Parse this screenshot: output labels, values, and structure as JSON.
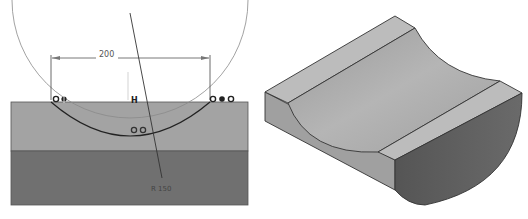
{
  "sketch": {
    "dimension_width": "200",
    "radius_label": "R 150",
    "constraint_left": [
      "coincident",
      "fix"
    ],
    "constraint_right": [
      "coincident",
      "fix",
      "coincident"
    ],
    "constraint_mid_top": "H",
    "constraint_arc": [
      "coincident",
      "coincident"
    ]
  },
  "isometric": {
    "description": "Extruded block with concave cylindrical groove"
  },
  "colors": {
    "upper_band": "#a3a3a3",
    "lower_band": "#707070",
    "sketch_line": "#333333",
    "construction_circle": "#888888",
    "iso_top": "#b8b8b8",
    "iso_groove": "#a8a8a8",
    "iso_front": "#9c9c9c",
    "iso_side": "#5e5e5e"
  }
}
